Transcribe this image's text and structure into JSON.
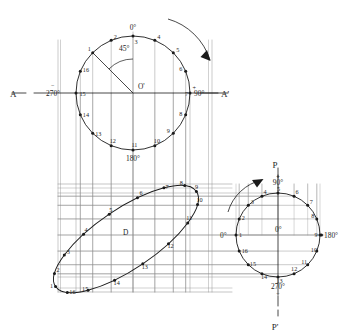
{
  "labels": {
    "axis_left": "A",
    "axis_right": "A'",
    "axis_top": "P",
    "axis_bottom": "P'",
    "angle_45": "45°",
    "center_top": "O'",
    "center_right": "0°",
    "ellipse_center": "D",
    "deg_0": "0°",
    "deg_90": "90°",
    "deg_180": "180°",
    "deg_270": "270°",
    "plus": "+",
    "minus": "−"
  },
  "top_circle": {
    "name": "plan-circle",
    "center": [
      133,
      93
    ],
    "radius": 57,
    "center_label": "O'",
    "top_label": "0°",
    "right_label": "90°",
    "bottom_label": "180°",
    "left_label": "270°",
    "angle_label": "45°",
    "divisions": 16,
    "point_labels": [
      "1",
      "2",
      "3",
      "4",
      "5",
      "6",
      "7",
      "8",
      "9",
      "10",
      "11",
      "12",
      "13",
      "14",
      "15",
      "16"
    ],
    "rotation_arrow": "clockwise"
  },
  "ellipse": {
    "name": "projected-ellipse",
    "center": [
      126,
      239
    ],
    "semi_major": 85,
    "semi_minor": 30,
    "tilt_deg": -34,
    "center_label": "D",
    "divisions": 16,
    "point_labels": [
      "1",
      "2",
      "3",
      "4",
      "5",
      "6",
      "7",
      "8",
      "9",
      "10",
      "11",
      "12",
      "13",
      "14",
      "15",
      "16"
    ]
  },
  "right_circle": {
    "name": "side-view-circle",
    "center": [
      278,
      235
    ],
    "radius": 42,
    "center_label": "0°",
    "top_label": "90°",
    "right_label": "180°",
    "bottom_label": "270°",
    "left_label": "0°",
    "divisions": 16,
    "point_labels": [
      "1",
      "2",
      "3",
      "4",
      "5",
      "6",
      "7",
      "8",
      "9",
      "10",
      "11",
      "12",
      "13",
      "14",
      "15",
      "16"
    ],
    "rotation_arrow": "counterclockwise"
  },
  "colors": {
    "ink": "#1a1a1a",
    "construction": "#8a8a8a",
    "light_grid": "#9b9b9b",
    "paper": "#ffffff"
  }
}
